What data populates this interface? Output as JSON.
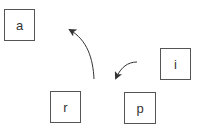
{
  "diagram": {
    "boxes": [
      {
        "id": "a",
        "label": "a",
        "x": 4,
        "y": 9,
        "w": 31,
        "h": 32
      },
      {
        "id": "i",
        "label": "i",
        "x": 160,
        "y": 48,
        "w": 31,
        "h": 32
      },
      {
        "id": "r",
        "label": "r",
        "x": 50,
        "y": 91,
        "w": 31,
        "h": 32
      },
      {
        "id": "p",
        "label": "p",
        "x": 124,
        "y": 92,
        "w": 32,
        "h": 32
      }
    ],
    "arrows": [
      {
        "id": "arrow-up",
        "from": [
          94,
          79
        ],
        "to": [
          68,
          29
        ]
      },
      {
        "id": "arrow-left",
        "from": [
          137,
          62
        ],
        "to": [
          114,
          80
        ]
      }
    ],
    "colors": {
      "stroke": "#555555",
      "text": "#333333",
      "arrow": "#333333"
    }
  }
}
